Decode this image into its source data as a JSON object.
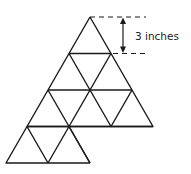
{
  "diagram": {
    "dimension_label": "3 inches",
    "line_color": "#1a1a1a"
  }
}
